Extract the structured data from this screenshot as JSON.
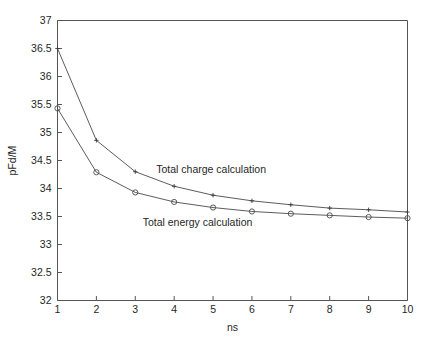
{
  "chart_data": {
    "type": "line",
    "title": "",
    "xlabel": "ns",
    "ylabel": "pFd/M",
    "xlim": [
      1,
      10
    ],
    "ylim": [
      32,
      37
    ],
    "x": [
      1,
      2,
      3,
      4,
      5,
      6,
      7,
      8,
      9,
      10
    ],
    "xticks": [
      "1",
      "2",
      "3",
      "4",
      "5",
      "6",
      "7",
      "8",
      "9",
      "10"
    ],
    "yticks": [
      "32",
      "32.5",
      "33",
      "33.5",
      "34",
      "34.5",
      "35",
      "35.5",
      "36",
      "36.5",
      "37"
    ],
    "ytick_values": [
      32,
      32.5,
      33,
      33.5,
      34,
      34.5,
      35,
      35.5,
      36,
      36.5,
      37
    ],
    "grid": false,
    "legend_position": "inline-annotation",
    "series": [
      {
        "name": "Total charge calculation",
        "marker": "cross",
        "values": [
          36.5,
          34.86,
          34.3,
          34.04,
          33.88,
          33.78,
          33.71,
          33.65,
          33.62,
          33.58
        ]
      },
      {
        "name": "Total energy calculation",
        "marker": "circle",
        "values": [
          35.43,
          34.29,
          33.93,
          33.76,
          33.66,
          33.59,
          33.55,
          33.52,
          33.49,
          33.47
        ]
      }
    ],
    "annotations": [
      {
        "text": "Total charge calculation",
        "x": 4.95,
        "y": 34.28
      },
      {
        "text": "Total energy calculation",
        "x": 4.6,
        "y": 33.33
      }
    ],
    "colors": {
      "line": "#4a4a4a",
      "axis": "#555555",
      "text": "#1f1f1f",
      "background": "#ffffff"
    }
  }
}
